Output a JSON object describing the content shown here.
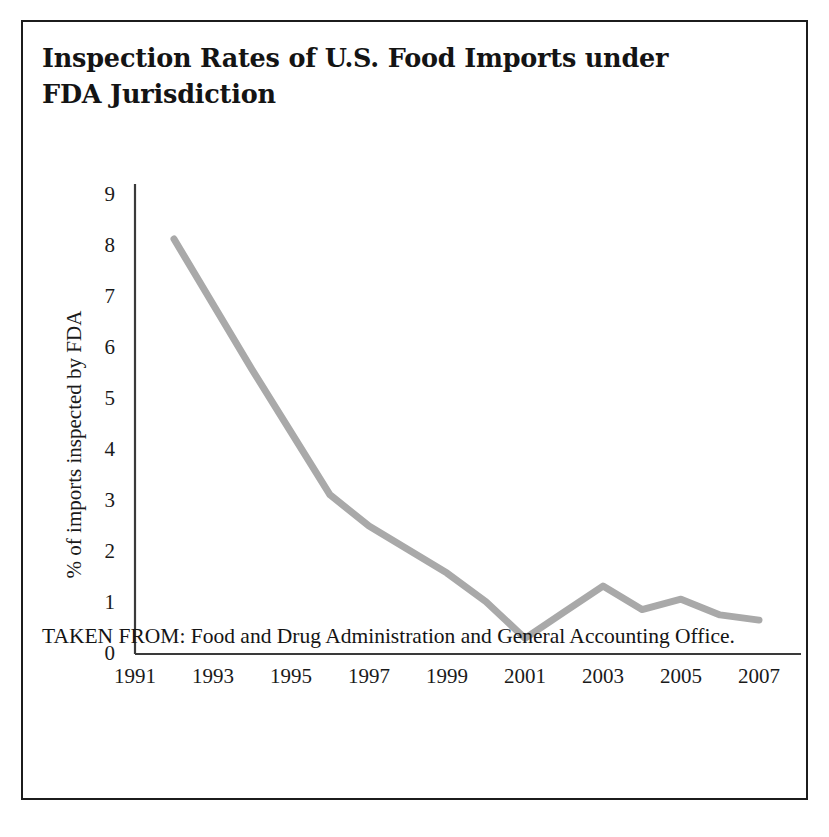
{
  "figure": {
    "title": "Inspection Rates of U.S. Food Imports under FDA Jurisdiction",
    "caption": "TAKEN FROM: Food and Drug Administration and General Accounting Office.",
    "border_color": "#1c1c1c",
    "background": "#ffffff"
  },
  "chart_data": {
    "type": "line",
    "title": "Inspection Rates of U.S. Food Imports under FDA Jurisdiction",
    "xlabel": "",
    "ylabel": "% of imports inspected by FDA",
    "xlim": [
      1991,
      2008
    ],
    "ylim": [
      0,
      9
    ],
    "grid": false,
    "legend": false,
    "line_color": "#a9a9a9",
    "line_width": 7,
    "axis_color": "#3a3a3a",
    "x_tick_labels": [
      "1991",
      "1993",
      "1995",
      "1997",
      "1999",
      "2001",
      "2003",
      "2005",
      "2007"
    ],
    "x_tick_values": [
      1991,
      1993,
      1995,
      1997,
      1999,
      2001,
      2003,
      2005,
      2007
    ],
    "y_tick_labels": [
      "0",
      "1",
      "2",
      "3",
      "4",
      "5",
      "6",
      "7",
      "8",
      "9"
    ],
    "y_tick_values": [
      0,
      1,
      2,
      3,
      4,
      5,
      6,
      7,
      8,
      9
    ],
    "series": [
      {
        "name": "% of imports inspected by FDA",
        "x": [
          1992,
          1993,
          1994,
          1995,
          1996,
          1997,
          1998,
          1999,
          2000,
          2001,
          2002,
          2003,
          2004,
          2005,
          2006,
          2007
        ],
        "values": [
          7.95,
          6.7,
          5.45,
          4.25,
          3.05,
          2.45,
          2.0,
          1.55,
          1.0,
          0.3,
          0.8,
          1.3,
          0.85,
          1.05,
          0.75,
          0.65
        ]
      }
    ]
  }
}
